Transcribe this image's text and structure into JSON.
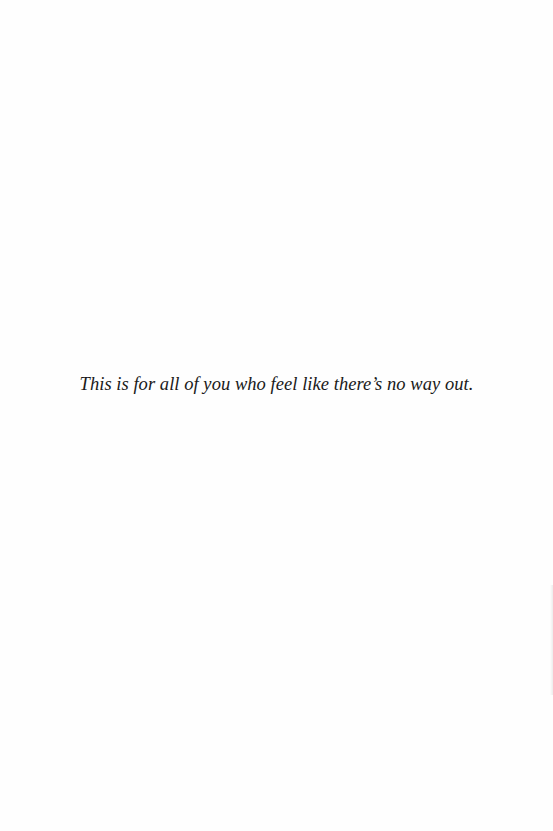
{
  "page": {
    "type": "dedication",
    "background_color": "#fefefe",
    "text_color": "#1a1a1a"
  },
  "dedication": {
    "text": "This is for all of you who feel like there’s no way out."
  }
}
